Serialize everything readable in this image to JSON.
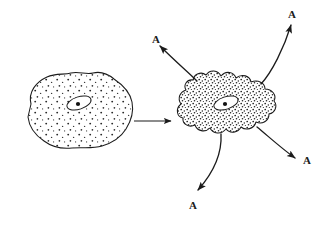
{
  "figure": {
    "background_color": "#ffffff",
    "ink_color": "#1b1b1b",
    "width": 328,
    "height": 228,
    "style": "hand-drawn line art, stippled shading"
  },
  "labels": [
    {
      "id": "a-top-left",
      "text": "A",
      "x": 152,
      "y": 34
    },
    {
      "id": "a-top-right",
      "text": "A",
      "x": 288,
      "y": 9
    },
    {
      "id": "a-bottom-right",
      "text": "A",
      "x": 303,
      "y": 155
    },
    {
      "id": "a-bottom",
      "text": "A",
      "x": 189,
      "y": 200
    }
  ],
  "cells": [
    {
      "id": "resting-cell",
      "name": "left-cell",
      "state": "resting",
      "outline": "smooth irregular blob",
      "stipple_density": "sparse",
      "center": [
        77,
        110
      ],
      "bounds": [
        22,
        72,
        133,
        150
      ],
      "nucleus": {
        "center": [
          79,
          103
        ],
        "rx": 12,
        "ry": 6,
        "rotation": -18,
        "nucleolus": true
      }
    },
    {
      "id": "active-cell",
      "name": "right-cell",
      "state": "activated",
      "outline": "lobed scalloped blob",
      "stipple_density": "dense",
      "center": [
        228,
        103
      ],
      "bounds": [
        178,
        70,
        277,
        137
      ],
      "nucleus": {
        "center": [
          226,
          103
        ],
        "rx": 12,
        "ry": 6,
        "rotation": -18,
        "nucleolus": true
      }
    }
  ],
  "arrows": [
    {
      "id": "transition-arrow",
      "type": "straight",
      "label": "",
      "from": [
        133,
        121
      ],
      "to": [
        173,
        121
      ],
      "direction": "right"
    },
    {
      "id": "secretion-arrow-top-left",
      "type": "curved",
      "label": "A",
      "from": [
        196,
        80
      ],
      "to": [
        157,
        44
      ],
      "direction": "up-left"
    },
    {
      "id": "secretion-arrow-top-right",
      "type": "curved",
      "label": "A",
      "from": [
        262,
        83
      ],
      "to": [
        292,
        22
      ],
      "direction": "up-right"
    },
    {
      "id": "secretion-arrow-bottom-right",
      "type": "curved",
      "label": "A",
      "from": [
        258,
        128
      ],
      "to": [
        297,
        160
      ],
      "direction": "down-right"
    },
    {
      "id": "secretion-arrow-bottom",
      "type": "curved",
      "label": "A",
      "from": [
        221,
        133
      ],
      "to": [
        196,
        193
      ],
      "direction": "down"
    }
  ],
  "legend": {
    "substance": "A",
    "meaning": "secreted substance"
  }
}
